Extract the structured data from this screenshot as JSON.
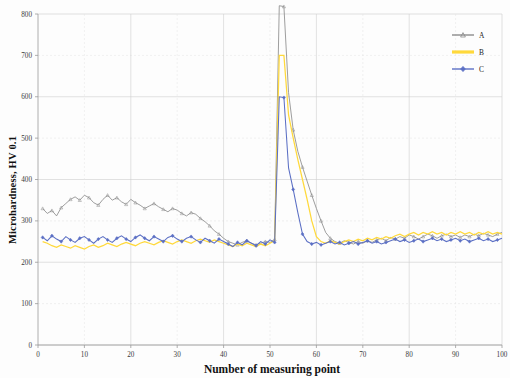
{
  "chart_data": {
    "type": "line",
    "title": "",
    "xlabel": "Number of measuring point",
    "ylabel": "Microhardness, HV 0.1",
    "xlim": [
      0,
      100
    ],
    "ylim": [
      0,
      800
    ],
    "xticks": [
      0,
      10,
      20,
      30,
      40,
      50,
      60,
      70,
      80,
      90,
      100
    ],
    "yticks": [
      0,
      100,
      200,
      300,
      400,
      500,
      600,
      700,
      800
    ],
    "grid": true,
    "legend_position": "top-right",
    "colors": {
      "A": "#8c8c8c",
      "B": "#ffd93b",
      "C": "#5b6fc4"
    },
    "x": [
      1,
      2,
      3,
      4,
      5,
      6,
      7,
      8,
      9,
      10,
      11,
      12,
      13,
      14,
      15,
      16,
      17,
      18,
      19,
      20,
      21,
      22,
      23,
      24,
      25,
      26,
      27,
      28,
      29,
      30,
      31,
      32,
      33,
      34,
      35,
      36,
      37,
      38,
      39,
      40,
      41,
      42,
      43,
      44,
      45,
      46,
      47,
      48,
      49,
      50,
      51,
      52,
      53,
      54,
      55,
      56,
      57,
      58,
      59,
      60,
      61,
      62,
      63,
      64,
      65,
      66,
      67,
      68,
      69,
      70,
      71,
      72,
      73,
      74,
      75,
      76,
      77,
      78,
      79,
      80,
      81,
      82,
      83,
      84,
      85,
      86,
      87,
      88,
      89,
      90,
      91,
      92,
      93,
      94,
      95,
      96,
      97,
      98,
      99,
      100
    ],
    "series": [
      {
        "name": "A",
        "marker": "triangle",
        "values": [
          330,
          318,
          325,
          312,
          332,
          342,
          352,
          358,
          350,
          362,
          356,
          344,
          338,
          352,
          362,
          350,
          356,
          346,
          340,
          352,
          344,
          338,
          330,
          336,
          342,
          334,
          328,
          322,
          330,
          326,
          318,
          312,
          320,
          316,
          306,
          298,
          288,
          276,
          268,
          258,
          250,
          246,
          242,
          248,
          252,
          246,
          242,
          246,
          250,
          248,
          255,
          820,
          818,
          610,
          520,
          468,
          430,
          396,
          362,
          330,
          300,
          272,
          258,
          250,
          246,
          252,
          248,
          244,
          250,
          246,
          252,
          248,
          254,
          258,
          252,
          260,
          256,
          262,
          258,
          266,
          262,
          256,
          262,
          268,
          264,
          258,
          264,
          268,
          262,
          266,
          260,
          266,
          262,
          268,
          264,
          270,
          266,
          262,
          268,
          272
        ]
      },
      {
        "name": "B",
        "marker": "line",
        "values": [
          250,
          246,
          240,
          236,
          242,
          238,
          234,
          240,
          236,
          232,
          238,
          242,
          236,
          240,
          246,
          242,
          238,
          244,
          248,
          244,
          240,
          246,
          250,
          246,
          242,
          248,
          252,
          248,
          244,
          250,
          254,
          250,
          246,
          252,
          256,
          252,
          248,
          254,
          250,
          246,
          242,
          238,
          244,
          240,
          246,
          242,
          238,
          244,
          240,
          246,
          252,
          700,
          700,
          556,
          500,
          448,
          400,
          352,
          300,
          262,
          250,
          246,
          252,
          248,
          244,
          250,
          254,
          250,
          256,
          252,
          258,
          254,
          260,
          256,
          262,
          258,
          264,
          268,
          262,
          268,
          272,
          266,
          272,
          268,
          274,
          268,
          272,
          266,
          272,
          268,
          274,
          268,
          272,
          266,
          272,
          268,
          274,
          268,
          272,
          268
        ]
      },
      {
        "name": "C",
        "marker": "diamond",
        "values": [
          260,
          252,
          264,
          256,
          250,
          262,
          254,
          248,
          258,
          262,
          254,
          246,
          256,
          262,
          254,
          248,
          258,
          264,
          256,
          250,
          260,
          266,
          258,
          252,
          262,
          256,
          250,
          260,
          264,
          256,
          250,
          258,
          262,
          254,
          248,
          258,
          252,
          246,
          256,
          250,
          244,
          238,
          248,
          242,
          252,
          246,
          240,
          250,
          244,
          254,
          248,
          600,
          598,
          428,
          376,
          320,
          268,
          250,
          244,
          248,
          242,
          246,
          250,
          244,
          248,
          242,
          246,
          250,
          244,
          248,
          252,
          246,
          250,
          244,
          248,
          252,
          256,
          250,
          254,
          248,
          252,
          256,
          250,
          254,
          258,
          252,
          256,
          250,
          254,
          258,
          252,
          256,
          250,
          254,
          258,
          252,
          256,
          250,
          254,
          258
        ]
      }
    ]
  },
  "legend": {
    "items": [
      {
        "label": "A",
        "color": "#8c8c8c"
      },
      {
        "label": "B",
        "color": "#ffd93b"
      },
      {
        "label": "C",
        "color": "#5b6fc4"
      }
    ]
  },
  "axes": {
    "y_title": "Microhardness, HV 0.1",
    "x_title": "Number of measuring point"
  }
}
